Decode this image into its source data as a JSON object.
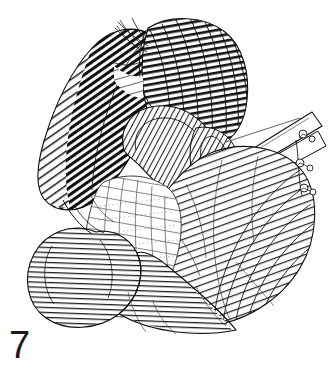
{
  "plate": {
    "figure_number": "7",
    "background_color": "#ffffff",
    "ink_color": "#111111",
    "medium": "engraving-line-drawing",
    "subject": "anatomical dissection of abdominal viscera",
    "caption": ""
  },
  "figure_data": {
    "type": "line-engraving",
    "width": 336,
    "height": 370,
    "drawing_bounds": {
      "x": 25,
      "y": 15,
      "width": 295,
      "height": 325
    },
    "structures": [
      {
        "name": "upper-left-lobe",
        "label": "",
        "hatch_style": "dense-diagonal",
        "hatch_angle_deg": 55,
        "tone": "very-dark",
        "bounds": {
          "x": 38,
          "y": 30,
          "width": 115,
          "height": 175
        }
      },
      {
        "name": "upper-right-lobe",
        "label": "",
        "hatch_style": "radiating-curved",
        "hatch_angle_deg": 80,
        "tone": "dark",
        "bounds": {
          "x": 140,
          "y": 18,
          "width": 110,
          "height": 130
        }
      },
      {
        "name": "central-tubular-loop",
        "label": "",
        "hatch_style": "fine-cross-contour",
        "hatch_angle_deg": 30,
        "tone": "medium",
        "bounds": {
          "x": 110,
          "y": 110,
          "width": 120,
          "height": 95
        }
      },
      {
        "name": "diagonal-band-retractor",
        "label": "",
        "hatch_style": "outline-only",
        "hatch_angle_deg": 25,
        "tone": "light",
        "bounds": {
          "x": 180,
          "y": 108,
          "width": 135,
          "height": 85
        }
      },
      {
        "name": "right-mass",
        "label": "",
        "hatch_style": "radiating-fine",
        "hatch_angle_deg": 70,
        "tone": "medium-light",
        "bounds": {
          "x": 175,
          "y": 150,
          "width": 145,
          "height": 175
        }
      },
      {
        "name": "lower-left-bowel-loop",
        "label": "",
        "hatch_style": "perpendicular-ribs",
        "hatch_angle_deg": 90,
        "tone": "medium",
        "bounds": {
          "x": 25,
          "y": 225,
          "width": 135,
          "height": 110
        }
      },
      {
        "name": "central-membrane-sheet",
        "label": "",
        "hatch_style": "stipple-and-flow-lines",
        "hatch_angle_deg": 75,
        "tone": "light",
        "bounds": {
          "x": 70,
          "y": 175,
          "width": 115,
          "height": 140
        }
      },
      {
        "name": "nodule-cluster",
        "label": "",
        "hatch_style": "outline-circles",
        "hatch_angle_deg": 0,
        "tone": "light",
        "bounds": {
          "x": 286,
          "y": 128,
          "width": 34,
          "height": 70
        }
      }
    ],
    "nodules": [
      {
        "cx": 303,
        "cy": 134,
        "r": 4
      },
      {
        "cx": 312,
        "cy": 139,
        "r": 3
      },
      {
        "cx": 300,
        "cy": 163,
        "r": 4
      },
      {
        "cx": 310,
        "cy": 168,
        "r": 3
      },
      {
        "cx": 304,
        "cy": 188,
        "r": 4
      },
      {
        "cx": 313,
        "cy": 192,
        "r": 3
      }
    ]
  }
}
